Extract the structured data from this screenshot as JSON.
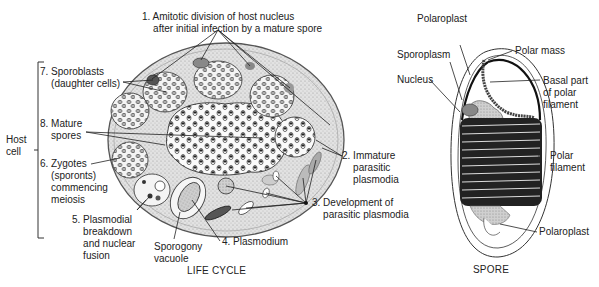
{
  "life_cycle": {
    "caption": "LIFE CYCLE",
    "host_cell_label": "Host\ncell",
    "labels": [
      {
        "id": "step-1",
        "text": "1. Amitotic division of host nucleus\n    after initial infection by a mature spore"
      },
      {
        "id": "step-2",
        "text": "2. Immature\n    parasitic\n    plasmodia"
      },
      {
        "id": "step-3",
        "text": "3. Development of\n    parasitic plasmodia"
      },
      {
        "id": "step-4",
        "text": "4. Plasmodium"
      },
      {
        "id": "step-5",
        "text": "5. Plasmodial\n    breakdown\n    and nuclear\n    fusion"
      },
      {
        "id": "step-6",
        "text": "6. Zygotes\n    (sporonts)\n    commencing\n    meiosis"
      },
      {
        "id": "step-7",
        "text": "7. Sporoblasts\n    (daughter cells)"
      },
      {
        "id": "step-8",
        "text": "8. Mature\n    spores"
      },
      {
        "id": "sporogony-vacuole",
        "text": "Sporogony\nvacuole"
      }
    ]
  },
  "spore": {
    "caption": "SPORE",
    "labels": [
      {
        "id": "polaroplast-top",
        "text": "Polaroplast"
      },
      {
        "id": "sporoplasm",
        "text": "Sporoplasm"
      },
      {
        "id": "nucleus",
        "text": "Nucleus"
      },
      {
        "id": "polar-mass",
        "text": "Polar mass"
      },
      {
        "id": "basal-part",
        "text": "Basal part\nof polar\nfilament"
      },
      {
        "id": "polar-filament",
        "text": "Polar\nfilament"
      },
      {
        "id": "polaroplast-bottom",
        "text": "Polaroplast"
      }
    ]
  }
}
